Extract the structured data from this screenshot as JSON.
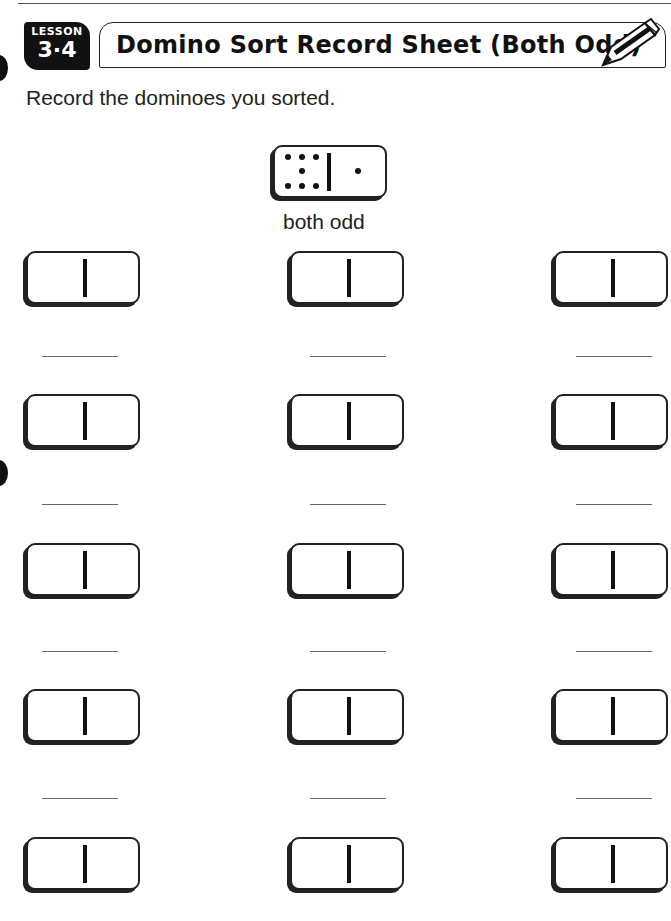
{
  "header": {
    "lesson_label": "LESSON",
    "lesson_number": "3·4",
    "title": "Domino Sort Record Sheet (Both Odd)"
  },
  "instructions": "Record the dominoes you sorted.",
  "example": {
    "left_pips": 7,
    "right_pips": 1,
    "caption": "both odd"
  },
  "grid": {
    "rows": 5,
    "columns": 3,
    "domino_count": 15,
    "answer_lines": 12
  }
}
